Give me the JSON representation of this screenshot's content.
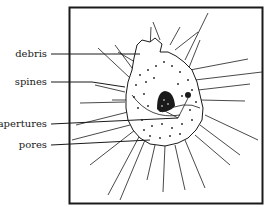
{
  "figure": {
    "labels": [
      {
        "id": "debris",
        "text": "debris",
        "y": 54
      },
      {
        "id": "spines",
        "text": "spines",
        "y": 82
      },
      {
        "id": "apertures",
        "text": "apertures",
        "y": 124
      },
      {
        "id": "pores",
        "text": "pores",
        "y": 145
      }
    ],
    "colors": {
      "ink": "#1a1a1a",
      "background": "#ffffff"
    }
  }
}
